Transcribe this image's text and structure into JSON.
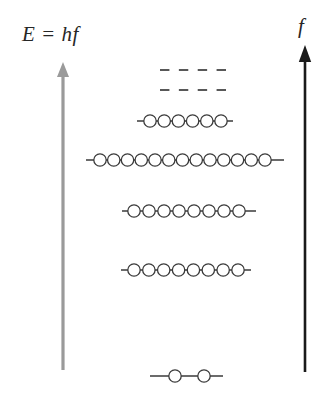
{
  "diagram": {
    "width": 335,
    "height": 412,
    "background_color": "#ffffff"
  },
  "axes": {
    "energy": {
      "label": "E = hf",
      "icon": "up-arrow-icon",
      "color": "#9a9a9a",
      "x": 63,
      "y_bottom": 370,
      "y_top": 62,
      "arrowhead": "up"
    },
    "frequency": {
      "label": "f",
      "icon": "up-arrow-icon",
      "color": "#1a1a1a",
      "x": 305,
      "y_bottom": 372,
      "y_top": 45,
      "arrowhead": "up"
    }
  },
  "line_color": "#3a3a3a",
  "circle_stroke_color": "#3a3a3a",
  "circle_fill_color": "#ffffff",
  "circle_radius": 6.2,
  "dashed_levels": [
    {
      "name": "dashed-level-upper",
      "y": 70,
      "x1": 160,
      "x2": 226,
      "dashes": 4
    },
    {
      "name": "dashed-level-lower",
      "y": 90,
      "x1": 160,
      "x2": 226,
      "dashes": 4
    }
  ],
  "energy_levels": [
    {
      "name": "energy-level-5",
      "y": 121,
      "x1": 137,
      "x2": 233,
      "electron_count": 6,
      "electrons_x1": 150,
      "electrons_x2": 221,
      "spacing": "even"
    },
    {
      "name": "energy-level-4",
      "y": 160,
      "x1": 86,
      "x2": 284,
      "electron_count": 13,
      "electrons_x1": 100,
      "electrons_x2": 265,
      "spacing": "even"
    },
    {
      "name": "energy-level-3",
      "y": 211,
      "x1": 122,
      "x2": 256,
      "electron_count": 8,
      "electrons_x1": 134,
      "electrons_x2": 239,
      "spacing": "even"
    },
    {
      "name": "energy-level-2",
      "y": 270,
      "x1": 121,
      "x2": 251,
      "electron_count": 8,
      "electrons_x1": 134,
      "electrons_x2": 238,
      "spacing": "even"
    },
    {
      "name": "energy-level-1",
      "y": 376,
      "x1": 150,
      "x2": 223,
      "electron_count": 2,
      "electrons_x1": 175,
      "electrons_x2": 204,
      "spacing": "wide"
    }
  ],
  "chart_data": {
    "type": "diagram",
    "xlabel": "",
    "ylabel": "E = hf",
    "secondary_ylabel": "f",
    "categories": [
      "level-1",
      "level-2",
      "level-3",
      "level-4",
      "level-5",
      "dashed-level-lower",
      "dashed-level-upper"
    ],
    "values": [
      2,
      8,
      8,
      13,
      6,
      null,
      null
    ],
    "series": [
      {
        "name": "electrons per level",
        "values": [
          2,
          8,
          8,
          13,
          6,
          null,
          null
        ]
      },
      {
        "name": "level width (px)",
        "values": [
          73,
          130,
          134,
          198,
          96,
          66,
          66
        ]
      },
      {
        "name": "level y position (px)",
        "values": [
          376,
          270,
          211,
          160,
          121,
          90,
          70
        ]
      }
    ],
    "grid": false,
    "legend": "none",
    "annotations": [
      "E = hf",
      "f",
      "dashed lines indicate continuation of higher levels"
    ]
  }
}
